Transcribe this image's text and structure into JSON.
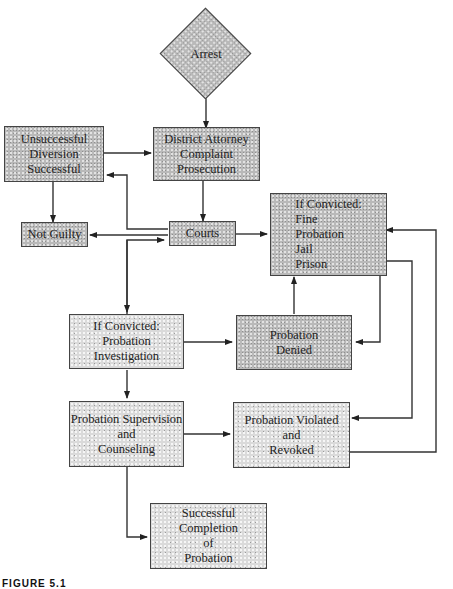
{
  "diagram": {
    "type": "flowchart",
    "nodes": {
      "arrest": {
        "label": "Arrest"
      },
      "diversion": {
        "label": "Unsuccessful\nDiversion\nSuccessful"
      },
      "district_attorney": {
        "label": "District Attorney\nComplaint\nProsecution"
      },
      "not_guilty": {
        "label": "Not Guilty"
      },
      "courts": {
        "label": "Courts"
      },
      "convicted_sentence": {
        "label": "If Convicted:\n   Fine\n   Probation\n   Jail\n   Prison"
      },
      "probation_investigation": {
        "label": "If Convicted:\nProbation\nInvestigation"
      },
      "probation_denied": {
        "label": "Probation\nDenied"
      },
      "probation_supervision": {
        "label": "Probation Supervision\nand\nCounseling"
      },
      "probation_violated": {
        "label": "Probation Violated\nand\nRevoked"
      },
      "successful_completion": {
        "label": "Successful Completion\nof\nProbation"
      }
    },
    "edges": [
      {
        "from": "Arrest",
        "to": "District Attorney Complaint Prosecution"
      },
      {
        "from": "Unsuccessful Diversion Successful",
        "to": "District Attorney Complaint Prosecution"
      },
      {
        "from": "Unsuccessful Diversion Successful",
        "to": "Not Guilty"
      },
      {
        "from": "District Attorney Complaint Prosecution",
        "to": "Courts"
      },
      {
        "from": "Courts",
        "to": "Unsuccessful Diversion Successful"
      },
      {
        "from": "Courts",
        "to": "Not Guilty"
      },
      {
        "from": "Courts",
        "to": "If Convicted: Fine Probation Jail Prison"
      },
      {
        "from": "Courts",
        "to": "If Convicted: Probation Investigation",
        "bidirectional": true
      },
      {
        "from": "If Convicted: Probation Investigation",
        "to": "Probation Denied"
      },
      {
        "from": "If Convicted: Probation Investigation",
        "to": "Probation Supervision and Counseling"
      },
      {
        "from": "Probation Denied",
        "to": "If Convicted: Fine Probation Jail Prison"
      },
      {
        "from": "If Convicted: Fine Probation Jail Prison",
        "to": "Probation Denied"
      },
      {
        "from": "If Convicted: Fine Probation Jail Prison",
        "to": "Probation Violated and Revoked"
      },
      {
        "from": "Probation Violated and Revoked",
        "to": "If Convicted: Fine Probation Jail Prison"
      },
      {
        "from": "Probation Supervision and Counseling",
        "to": "Probation Violated and Revoked"
      },
      {
        "from": "Probation Supervision and Counseling",
        "to": "Successful Completion of Probation"
      }
    ]
  },
  "caption": "FIGURE 5.1",
  "colors": {
    "box_dark": "#b9b9b9",
    "box_light": "#dadada",
    "line": "#333333"
  }
}
